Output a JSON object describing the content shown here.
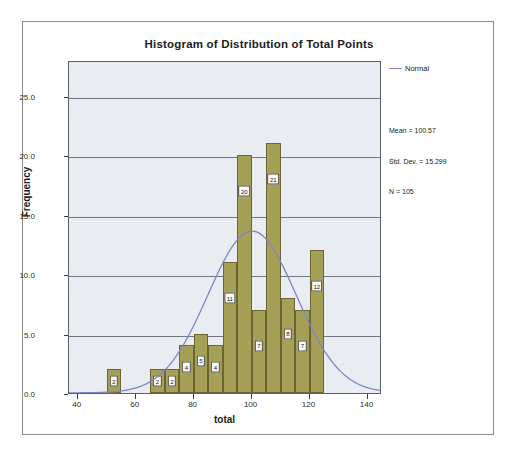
{
  "chart_data": {
    "type": "bar",
    "title": "Histogram of Distribution of Total Points",
    "xlabel": "total",
    "ylabel": "Frequency",
    "xlim": [
      37,
      145
    ],
    "ylim": [
      0,
      28
    ],
    "grid": true,
    "bin_width": 5,
    "bin_centers": [
      52.5,
      67.5,
      72.5,
      77.5,
      82.5,
      87.5,
      92.5,
      97.5,
      102.5,
      107.5,
      112.5,
      117.5,
      122.5
    ],
    "values": [
      2,
      2,
      2,
      4,
      5,
      4,
      11,
      20,
      7,
      21,
      8,
      7,
      12
    ],
    "bar_labels": [
      "2",
      "2",
      "2",
      "4",
      "5",
      "4",
      "11",
      "20",
      "7",
      "21",
      "8",
      "7",
      "12"
    ],
    "xticks": [
      "40",
      "60",
      "80",
      "100",
      "120",
      "140"
    ],
    "xtick_values": [
      40,
      60,
      80,
      100,
      120,
      140
    ],
    "yticks": [
      "0.0",
      "5.0",
      "10.0",
      "15.0",
      "20.0",
      "25.0"
    ],
    "ytick_values": [
      0,
      5,
      10,
      15,
      20,
      25
    ],
    "legend_position": "right",
    "series": [
      {
        "name": "Normal",
        "type": "line",
        "mean": 100.57,
        "std_dev": 15.299,
        "n": 105,
        "color": "#7b85c4"
      }
    ],
    "bar_color": "#a6a057",
    "annotations": [
      "Mean = 100.57",
      "Std. Dev. = 15.299",
      "N = 105"
    ]
  },
  "legend": {
    "normal_label": "Normal"
  },
  "stats": {
    "mean": "Mean = 100.57",
    "std_dev": "Std. Dev. = 15.299",
    "n": "N = 105"
  }
}
